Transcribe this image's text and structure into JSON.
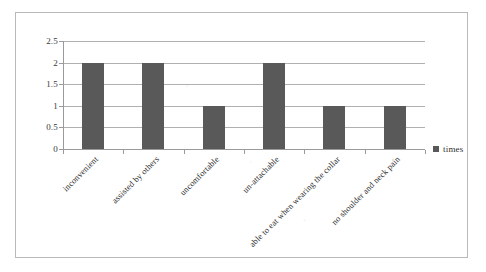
{
  "chart_data": {
    "type": "bar",
    "title": "",
    "xlabel": "",
    "ylabel": "",
    "categories": [
      "inconvenient",
      "assisted by others",
      "uncomfortable",
      "un-attachable",
      "able to eat when wearing the collar",
      "no shoulder and neck pain"
    ],
    "values": [
      2,
      2,
      1,
      2,
      1,
      1
    ],
    "series": [
      {
        "name": "times",
        "values": [
          2,
          2,
          1,
          2,
          1,
          1
        ]
      }
    ],
    "ylim": [
      0,
      2.5
    ],
    "ytick_labels": [
      "0",
      "0.5",
      "1",
      "1.5",
      "2",
      "2.5"
    ],
    "ytick_values": [
      0,
      0.5,
      1,
      1.5,
      2,
      2.5
    ],
    "grid": true,
    "legend": {
      "position": "right",
      "entries": [
        {
          "label": "times",
          "color": "#595959",
          "marker": "square"
        }
      ]
    },
    "bar_color": "#595959",
    "xtick_label_rotation": -45
  }
}
